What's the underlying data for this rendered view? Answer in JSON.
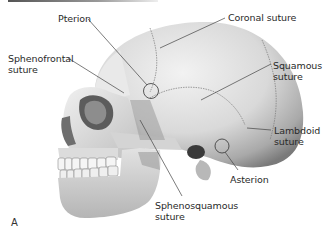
{
  "figure": {
    "panel_label": "A",
    "labels": [
      {
        "id": "pterion",
        "line1": "Pterion",
        "line2": ""
      },
      {
        "id": "coronal",
        "line1": "Coronal suture",
        "line2": ""
      },
      {
        "id": "sphenofrontal",
        "line1": "Sphenofrontal",
        "line2": "suture"
      },
      {
        "id": "squamous",
        "line1": "Squamous",
        "line2": "suture"
      },
      {
        "id": "lambdoid",
        "line1": "Lambdoid",
        "line2": "suture"
      },
      {
        "id": "asterion",
        "line1": "Asterion",
        "line2": ""
      },
      {
        "id": "sphenosquamous",
        "line1": "Sphenosquamous",
        "line2": "suture"
      }
    ]
  },
  "colors": {
    "bone_light": "#ececec",
    "bone_mid": "#c8c8c8",
    "bone_dark": "#8a8a8a",
    "shadow": "#3a3a3a",
    "leader_line": "#444444",
    "text": "#2a2a2a"
  }
}
